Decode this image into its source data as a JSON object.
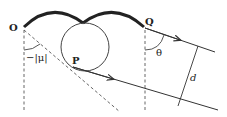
{
  "labels": {
    "O": "O",
    "Q": "Q",
    "P": "P",
    "mu": "−|μ|",
    "theta": "θ",
    "d": "d"
  },
  "colors": {
    "stroke": "#333333",
    "background": "#ffffff"
  }
}
